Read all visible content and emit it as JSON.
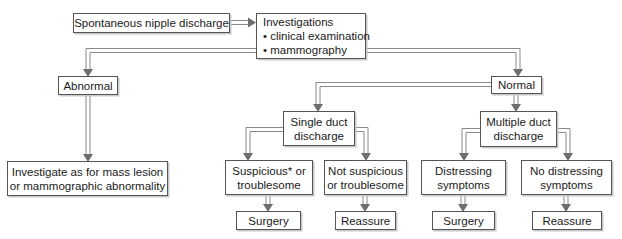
{
  "diagram": {
    "type": "flowchart",
    "nodes": {
      "start": {
        "lines": [
          "Spontaneous nipple discharge"
        ]
      },
      "investigations": {
        "lines": [
          "Investigations",
          "• clinical examination",
          "• mammography"
        ]
      },
      "abnormal": {
        "lines": [
          "Abnormal"
        ]
      },
      "normal": {
        "lines": [
          "Normal"
        ]
      },
      "investigate_mass": {
        "lines": [
          "Investigate as for mass lesion",
          "or mammographic abnormality"
        ]
      },
      "single_duct": {
        "lines": [
          "Single duct",
          "discharge"
        ]
      },
      "multiple_duct": {
        "lines": [
          "Multiple duct",
          "discharge"
        ]
      },
      "suspicious": {
        "lines": [
          "Suspicious* or",
          "troublesome"
        ]
      },
      "not_suspicious": {
        "lines": [
          "Not suspicious",
          "or troublesome"
        ]
      },
      "distressing": {
        "lines": [
          "Distressing",
          "symptoms"
        ]
      },
      "no_distressing": {
        "lines": [
          "No distressing",
          "symptoms"
        ]
      },
      "surgery_1": {
        "lines": [
          "Surgery"
        ]
      },
      "reassure_1": {
        "lines": [
          "Reassure"
        ]
      },
      "surgery_2": {
        "lines": [
          "Surgery"
        ]
      },
      "reassure_2": {
        "lines": [
          "Reassure"
        ]
      }
    },
    "edges": [
      [
        "start",
        "investigations"
      ],
      [
        "investigations",
        "abnormal"
      ],
      [
        "investigations",
        "normal"
      ],
      [
        "abnormal",
        "investigate_mass"
      ],
      [
        "normal",
        "single_duct"
      ],
      [
        "normal",
        "multiple_duct"
      ],
      [
        "single_duct",
        "suspicious"
      ],
      [
        "single_duct",
        "not_suspicious"
      ],
      [
        "multiple_duct",
        "distressing"
      ],
      [
        "multiple_duct",
        "no_distressing"
      ],
      [
        "suspicious",
        "surgery_1"
      ],
      [
        "not_suspicious",
        "reassure_1"
      ],
      [
        "distressing",
        "surgery_2"
      ],
      [
        "no_distressing",
        "reassure_2"
      ]
    ],
    "colors": {
      "border": "#555555",
      "connector": "#7a7a7a",
      "arrowhead": "#6e6e6e",
      "shadow": "#c8c8c8"
    }
  }
}
